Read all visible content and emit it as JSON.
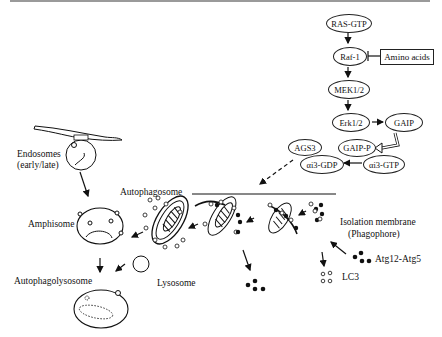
{
  "signaling": {
    "nodes": [
      "RAS-GTP",
      "Raf-1",
      "MEK1/2",
      "Erk1/2",
      "GAIP",
      "GAIP-P",
      "αi3-GTP",
      "αi3-GDP",
      "AGS3"
    ],
    "inhibitor": "Amino acids"
  },
  "labels": {
    "endosomes": "Endosomes",
    "endosomes_sub": "(early/late)",
    "autophagosome": "Autophagosome",
    "amphisome": "Amphisome",
    "isolation_membrane": "Isolation membrane",
    "isolation_membrane_sub": "(Phagophore)",
    "atg": "Atg12-Atg5",
    "lc3": "LC3",
    "lysosome": "Lysosome",
    "autophagolysosome": "Autophagolysosome"
  }
}
